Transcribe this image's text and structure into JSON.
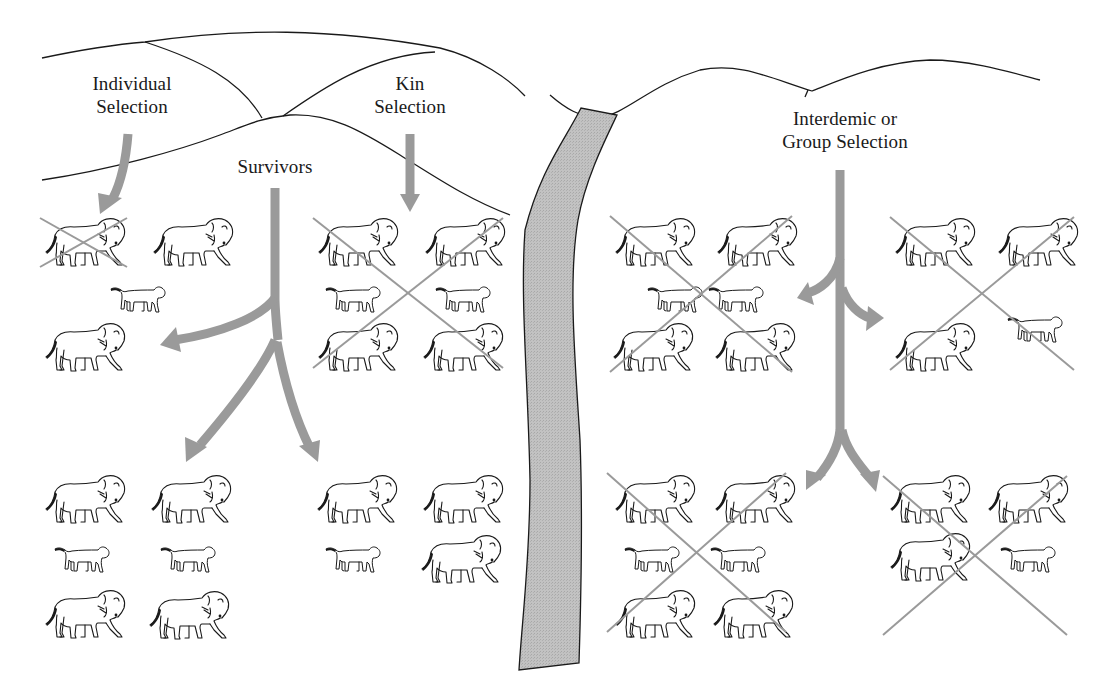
{
  "figure": {
    "labels": {
      "individual": {
        "line1": "Individual",
        "line2": "Selection"
      },
      "kin": {
        "line1": "Kin",
        "line2": "Selection"
      },
      "survivors": {
        "line1": "Survivors"
      },
      "group": {
        "line1": "Interdemic or",
        "line2": "Group Selection"
      }
    },
    "colors": {
      "arrow": "#9a9a9a",
      "river_fill": "#bdbdbd",
      "line": "#1a1a1a",
      "cross": "#9a9a9a"
    },
    "groups": [
      {
        "id": "A",
        "region": "individual-selection-top",
        "crossed_region": false,
        "animals": [
          {
            "type": "adult",
            "x": 40,
            "y": 215,
            "crossed": true
          },
          {
            "type": "adult",
            "x": 148,
            "y": 215,
            "crossed": false
          },
          {
            "type": "cub",
            "x": 108,
            "y": 280,
            "crossed": false
          },
          {
            "type": "adult",
            "x": 40,
            "y": 320,
            "crossed": false
          }
        ]
      },
      {
        "id": "B",
        "region": "kin-selection-top",
        "crossed_region": true,
        "cross": [
          313,
          218,
          503,
          368
        ],
        "animals": [
          {
            "type": "adult",
            "x": 313,
            "y": 215
          },
          {
            "type": "adult",
            "x": 420,
            "y": 215
          },
          {
            "type": "cub",
            "x": 323,
            "y": 280
          },
          {
            "type": "cub",
            "x": 433,
            "y": 280
          },
          {
            "type": "adult",
            "x": 313,
            "y": 320
          },
          {
            "type": "adult",
            "x": 418,
            "y": 320
          }
        ]
      },
      {
        "id": "C",
        "region": "survivors-left",
        "crossed_region": false,
        "animals": [
          {
            "type": "adult",
            "x": 40,
            "y": 472
          },
          {
            "type": "adult",
            "x": 146,
            "y": 472
          },
          {
            "type": "cub",
            "x": 52,
            "y": 540
          },
          {
            "type": "cub",
            "x": 158,
            "y": 540
          },
          {
            "type": "adult",
            "x": 40,
            "y": 587
          },
          {
            "type": "adult",
            "x": 144,
            "y": 588
          }
        ]
      },
      {
        "id": "D",
        "region": "survivors-right",
        "crossed_region": false,
        "animals": [
          {
            "type": "adult",
            "x": 312,
            "y": 472
          },
          {
            "type": "adult",
            "x": 418,
            "y": 472
          },
          {
            "type": "cub",
            "x": 323,
            "y": 540
          },
          {
            "type": "adult",
            "x": 416,
            "y": 532
          }
        ]
      },
      {
        "id": "E",
        "region": "group-selection-top-left",
        "crossed_region": true,
        "cross": [
          610,
          216,
          792,
          372
        ],
        "animals": [
          {
            "type": "adult",
            "x": 610,
            "y": 215
          },
          {
            "type": "adult",
            "x": 712,
            "y": 215
          },
          {
            "type": "cub",
            "x": 645,
            "y": 280
          },
          {
            "type": "cub",
            "x": 706,
            "y": 280
          },
          {
            "type": "adult",
            "x": 608,
            "y": 320
          },
          {
            "type": "adult",
            "x": 710,
            "y": 320
          }
        ]
      },
      {
        "id": "F",
        "region": "group-selection-top-right",
        "crossed_region": true,
        "cross": [
          890,
          217,
          1074,
          370
        ],
        "animals": [
          {
            "type": "adult",
            "x": 890,
            "y": 215
          },
          {
            "type": "adult",
            "x": 993,
            "y": 215
          },
          {
            "type": "cub",
            "x": 1005,
            "y": 310
          },
          {
            "type": "adult",
            "x": 890,
            "y": 320
          }
        ]
      },
      {
        "id": "G",
        "region": "group-selection-bottom-left",
        "crossed_region": true,
        "cross": [
          607,
          473,
          786,
          632
        ],
        "animals": [
          {
            "type": "adult",
            "x": 610,
            "y": 472
          },
          {
            "type": "adult",
            "x": 710,
            "y": 472
          },
          {
            "type": "cub",
            "x": 622,
            "y": 540
          },
          {
            "type": "cub",
            "x": 708,
            "y": 540
          },
          {
            "type": "adult",
            "x": 610,
            "y": 587
          },
          {
            "type": "adult",
            "x": 708,
            "y": 587
          }
        ]
      },
      {
        "id": "H",
        "region": "group-selection-bottom-right",
        "crossed_region": true,
        "cross": [
          883,
          476,
          1067,
          635
        ],
        "animals": [
          {
            "type": "adult",
            "x": 885,
            "y": 472
          },
          {
            "type": "adult",
            "x": 983,
            "y": 472
          },
          {
            "type": "adult",
            "x": 885,
            "y": 530
          },
          {
            "type": "cub",
            "x": 998,
            "y": 540
          }
        ]
      }
    ]
  }
}
